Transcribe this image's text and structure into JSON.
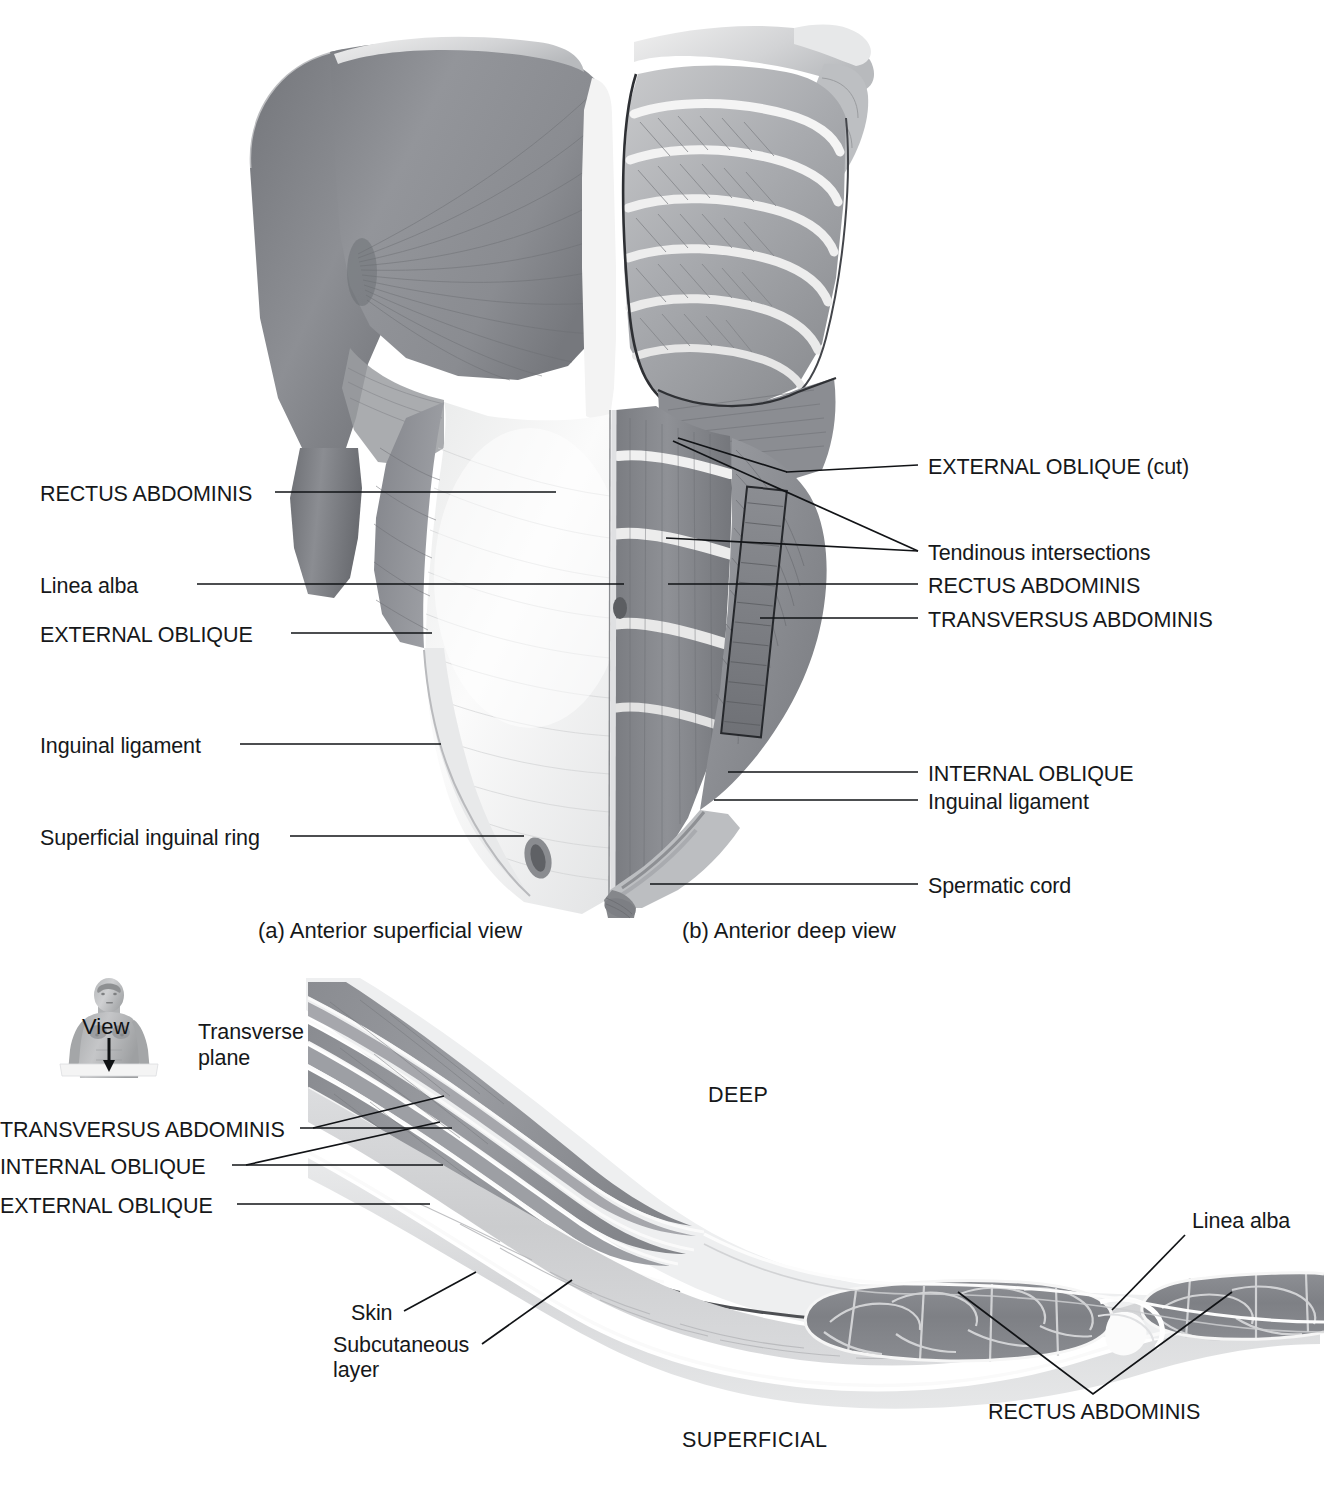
{
  "figure": {
    "panels": [
      {
        "id": "a",
        "caption": "(a) Anterior superficial view"
      },
      {
        "id": "b",
        "caption": "(b) Anterior deep view"
      },
      {
        "id": "c",
        "caption": ""
      }
    ]
  },
  "panel_a_labels": {
    "rectus_abdominis": "RECTUS ABDOMINIS",
    "linea_alba": "Linea alba",
    "external_oblique": "EXTERNAL OBLIQUE",
    "inguinal_ligament": "Inguinal ligament",
    "superficial_inguinal_ring": "Superficial inguinal ring"
  },
  "panel_b_labels": {
    "external_oblique_cut": "EXTERNAL OBLIQUE (cut)",
    "tendinous_intersections": "Tendinous intersections",
    "rectus_abdominis": "RECTUS ABDOMINIS",
    "transversus_abdominis": "TRANSVERSUS ABDOMINIS",
    "internal_oblique": "INTERNAL OBLIQUE",
    "inguinal_ligament": "Inguinal ligament",
    "spermatic_cord": "Spermatic cord"
  },
  "panel_c": {
    "orientation_deep": "DEEP",
    "orientation_superficial": "SUPERFICIAL",
    "labels": {
      "transversus_abdominis": "TRANSVERSUS ABDOMINIS",
      "internal_oblique": "INTERNAL OBLIQUE",
      "external_oblique": "EXTERNAL OBLIQUE",
      "skin": "Skin",
      "subcutaneous_layer": "Subcutaneous\nlayer",
      "subcutaneous_layer_line1": "Subcutaneous",
      "subcutaneous_layer_line2": "layer",
      "linea_alba": "Linea alba",
      "rectus_abdominis": "RECTUS ABDOMINIS"
    },
    "orientation_inset": {
      "view_label": "View",
      "plane_label_line1": "Transverse",
      "plane_label_line2": "plane"
    }
  },
  "colors": {
    "muscle_mid": "#8e9094",
    "muscle_dark": "#6e7074",
    "muscle_light": "#aaacb0",
    "tendon_white": "#f2f2f2",
    "fascia_light": "#d8d9db",
    "line": "#111316",
    "text": "#16181a",
    "background": "#ffffff"
  }
}
